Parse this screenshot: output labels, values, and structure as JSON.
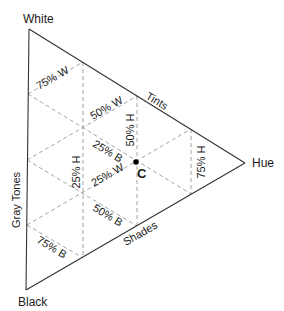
{
  "diagram": {
    "type": "color-triangle",
    "vertices": {
      "white": "White",
      "black": "Black",
      "hue": "Hue"
    },
    "edges": {
      "gray_tones": "Gray Tones",
      "tints": "Tints",
      "shades": "Shades"
    },
    "grid_labels": {
      "w75": "75% W",
      "w50": "50% W",
      "w25": "25% W",
      "b25": "25% B",
      "b50": "50% B",
      "b75": "75% B",
      "h25": "25% H",
      "h50": "50% H",
      "h75": "75% H"
    },
    "point": {
      "label": "C"
    },
    "colors": {
      "edge": "#333333",
      "grid": "#9a9a9a",
      "text": "#1a1a1a",
      "point": "#000000"
    }
  }
}
